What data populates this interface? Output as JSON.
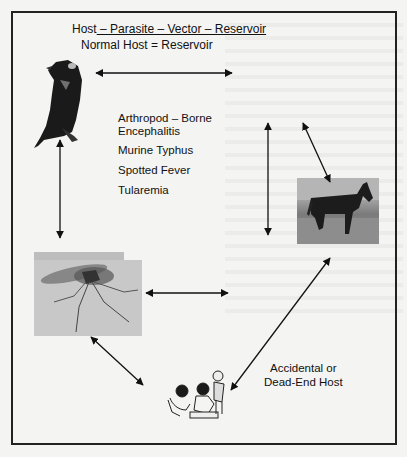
{
  "diagram": {
    "title": {
      "host": "Host",
      "rest": " – Parasite – Vector – Reservoir"
    },
    "subtitle": "Normal Host = Reservoir",
    "diseases": [
      "Arthropod – Borne Encephalitis",
      "Murine Typhus",
      "Spotted Fever",
      "Tularemia"
    ],
    "dead_end_label": {
      "line1": "Accidental or",
      "line2": "Dead-End Host"
    },
    "nodes": [
      {
        "id": "bird",
        "role": "Normal Host / Reservoir",
        "image": "bird-illustration"
      },
      {
        "id": "horse",
        "role": "Host",
        "image": "horse-photo"
      },
      {
        "id": "mosquito",
        "role": "Vector",
        "image": "mosquito-photo"
      },
      {
        "id": "humans",
        "role": "Accidental or Dead-End Host",
        "image": "children-illustration"
      }
    ],
    "edges": [
      {
        "from": "bird",
        "to": "right",
        "type": "bidirectional"
      },
      {
        "from": "bird",
        "to": "mosquito",
        "type": "bidirectional"
      },
      {
        "from": "center-top",
        "to": "center-bottom",
        "type": "bidirectional"
      },
      {
        "from": "top-right",
        "to": "horse",
        "type": "bidirectional"
      },
      {
        "from": "mosquito",
        "to": "right",
        "type": "bidirectional"
      },
      {
        "from": "mosquito",
        "to": "humans",
        "type": "bidirectional"
      },
      {
        "from": "horse",
        "to": "humans",
        "type": "bidirectional"
      }
    ]
  }
}
